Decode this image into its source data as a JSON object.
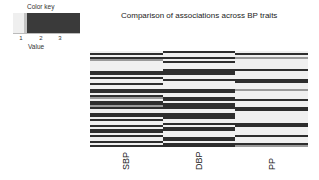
{
  "color_key": {
    "title": "Color key",
    "xlabel": "Value",
    "ticks": [
      {
        "label": "1",
        "pos": 8
      },
      {
        "label": "2",
        "pos": 28
      },
      {
        "label": "3",
        "pos": 47
      }
    ],
    "segments": [
      {
        "color": "#efefef",
        "width": 11
      },
      {
        "color": "#c4c4c4",
        "width": 3
      },
      {
        "color": "#3a3a3a",
        "width": 53
      }
    ]
  },
  "chart_data": {
    "type": "heatmap",
    "title": "Comparison of associations across BP traits",
    "xlabel": "",
    "ylabel": "",
    "columns": [
      "SBP",
      "DBP",
      "PP"
    ],
    "value_range": [
      1,
      3
    ],
    "legend": {
      "title": "Color key",
      "xlabel": "Value",
      "ticks": [
        "1",
        "2",
        "3"
      ],
      "position": "top-left"
    },
    "rows": 48,
    "values": {
      "SBP": [
        1,
        3,
        1,
        3,
        2,
        1,
        1,
        1,
        1,
        1,
        3,
        3,
        1,
        3,
        1,
        1,
        3,
        1,
        1,
        3,
        3,
        1,
        3,
        2,
        1,
        3,
        3,
        2,
        3,
        1,
        1,
        3,
        3,
        1,
        3,
        1,
        1,
        3,
        1,
        3,
        3,
        1,
        3,
        1,
        1,
        3,
        1,
        3
      ],
      "DBP": [
        3,
        1,
        1,
        3,
        1,
        3,
        1,
        1,
        1,
        3,
        3,
        3,
        1,
        1,
        3,
        1,
        1,
        1,
        1,
        3,
        3,
        1,
        1,
        3,
        3,
        1,
        3,
        3,
        3,
        1,
        1,
        3,
        3,
        3,
        1,
        1,
        3,
        1,
        3,
        3,
        1,
        1,
        1,
        3,
        3,
        1,
        3,
        3
      ],
      "PP": [
        1,
        3,
        1,
        2,
        1,
        1,
        1,
        1,
        1,
        3,
        1,
        1,
        1,
        1,
        3,
        3,
        1,
        1,
        1,
        2,
        1,
        1,
        1,
        1,
        3,
        1,
        1,
        1,
        3,
        3,
        1,
        1,
        1,
        1,
        1,
        1,
        3,
        3,
        1,
        1,
        1,
        1,
        3,
        1,
        1,
        1,
        3,
        2
      ]
    }
  },
  "colors": {
    "1": "#f0f0f0",
    "2": "#9a9a9a",
    "3": "#2e2e2e"
  }
}
